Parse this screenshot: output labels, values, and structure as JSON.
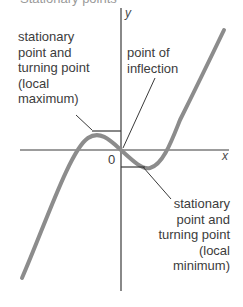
{
  "figure": {
    "top_cropped_text": "Stationary points",
    "axes": {
      "x_label": "x",
      "y_label": "y",
      "origin_label": "0"
    },
    "annotations": {
      "local_maximum": {
        "lines": [
          "stationary",
          "point and",
          "turning point",
          "(local",
          "maximum)"
        ]
      },
      "inflection": {
        "lines": [
          "point of",
          "inflection"
        ]
      },
      "local_minimum": {
        "lines": [
          "stationary",
          "point and",
          "turning point",
          "(local",
          "minimum)"
        ]
      }
    },
    "colors": {
      "curve": "#8c8c8c",
      "axes": "#3a3a3a",
      "text": "#3c3c3c"
    },
    "curve_description": "cubic curve with local maximum left of y-axis, inflection at origin, local minimum right of y-axis"
  }
}
